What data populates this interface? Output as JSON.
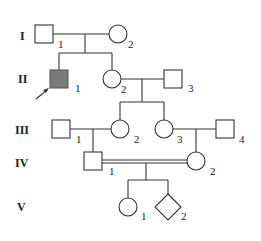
{
  "colors": {
    "line": "#333333",
    "affected_fill": "#7a7a7a",
    "background": "#ffffff"
  },
  "generations": [
    {
      "label": "I",
      "individuals": [
        {
          "id": "I-1",
          "number": "1",
          "sex": "male",
          "affected": false
        },
        {
          "id": "I-2",
          "number": "2",
          "sex": "female",
          "affected": false
        }
      ]
    },
    {
      "label": "II",
      "individuals": [
        {
          "id": "II-1",
          "number": "1",
          "sex": "male",
          "affected": true,
          "proband": true
        },
        {
          "id": "II-2",
          "number": "2",
          "sex": "female",
          "affected": false
        },
        {
          "id": "II-3",
          "number": "3",
          "sex": "male",
          "affected": false
        }
      ]
    },
    {
      "label": "III",
      "individuals": [
        {
          "id": "III-1",
          "number": "1",
          "sex": "male",
          "affected": false
        },
        {
          "id": "III-2",
          "number": "2",
          "sex": "female",
          "affected": false
        },
        {
          "id": "III-3",
          "number": "3",
          "sex": "female",
          "affected": false
        },
        {
          "id": "III-4",
          "number": "4",
          "sex": "male",
          "affected": false
        }
      ]
    },
    {
      "label": "IV",
      "individuals": [
        {
          "id": "IV-1",
          "number": "1",
          "sex": "male",
          "affected": false
        },
        {
          "id": "IV-2",
          "number": "2",
          "sex": "female",
          "affected": false
        }
      ]
    },
    {
      "label": "V",
      "individuals": [
        {
          "id": "V-1",
          "number": "1",
          "sex": "female",
          "affected": false
        },
        {
          "id": "V-2",
          "number": "2",
          "sex": "unknown",
          "affected": false
        }
      ]
    }
  ],
  "relationships": [
    {
      "type": "mating",
      "partners": [
        "I-1",
        "I-2"
      ],
      "children": [
        "II-1",
        "II-2"
      ]
    },
    {
      "type": "mating",
      "partners": [
        "II-2",
        "II-3"
      ],
      "children": [
        "III-2",
        "III-3"
      ]
    },
    {
      "type": "mating",
      "partners": [
        "III-1",
        "III-2"
      ],
      "children": [
        "IV-1"
      ]
    },
    {
      "type": "mating",
      "partners": [
        "III-3",
        "III-4"
      ],
      "children": [
        "IV-2"
      ]
    },
    {
      "type": "consanguineous-mating",
      "partners": [
        "IV-1",
        "IV-2"
      ],
      "children": [
        "V-1",
        "V-2"
      ]
    }
  ],
  "proband_marker": "arrow pointing to II-1"
}
